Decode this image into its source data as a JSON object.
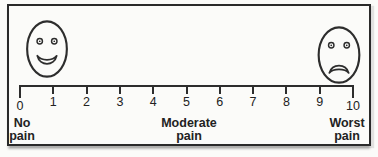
{
  "scale": {
    "ticks": [
      "0",
      "1",
      "2",
      "3",
      "4",
      "5",
      "6",
      "7",
      "8",
      "9",
      "10"
    ],
    "min_label": "No pain",
    "mid_label": "Moderate pain",
    "max_label": "Worst pain"
  },
  "faces": {
    "left": "smiling-face",
    "right": "frowning-face"
  },
  "colors": {
    "ink": "#2d2d2d",
    "paper": "#fbfbf9"
  }
}
